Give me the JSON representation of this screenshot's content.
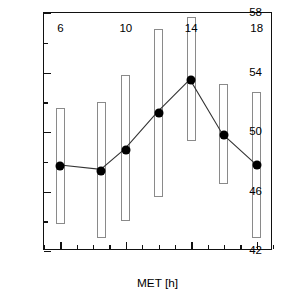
{
  "chart_data": {
    "type": "line",
    "title": "",
    "xlabel": "MET [h]",
    "ylabel": "Thermotolerance of PS II [°C]",
    "xlim": [
      5,
      19
    ],
    "ylim": [
      42,
      58
    ],
    "grid": false,
    "legend": null,
    "x_major_ticks": [
      6,
      10,
      14,
      18
    ],
    "x_minor_ticks": [
      5,
      7,
      8,
      9,
      11,
      12,
      13,
      15,
      16,
      17,
      19
    ],
    "x_tick_labels": [
      "6",
      "10",
      "14",
      "18"
    ],
    "y_major_ticks": [
      42,
      46,
      50,
      54,
      58
    ],
    "y_minor_ticks": [
      44,
      48,
      52,
      56
    ],
    "y_tick_labels": [
      "42",
      "46",
      "50",
      "54",
      "58"
    ],
    "marker": "filled-circle",
    "marker_color": "#000000",
    "line_color": "#333333",
    "errorbar_style": "open-rectangle",
    "errorbar_edge_color": "#8a8a8a",
    "errorbar_fill_color": "#ffffff",
    "x": [
      6,
      8.5,
      10,
      12,
      14,
      16,
      18
    ],
    "values": [
      47.7,
      47.4,
      48.8,
      51.3,
      53.5,
      49.8,
      47.8
    ],
    "range_low": [
      43.8,
      42.9,
      44.0,
      45.6,
      49.4,
      46.5,
      42.9
    ],
    "range_high": [
      51.6,
      52.0,
      53.8,
      56.9,
      57.7,
      53.2,
      52.7
    ],
    "points": [
      {
        "x": 6,
        "y": 47.7,
        "low": 43.8,
        "high": 51.6
      },
      {
        "x": 8.5,
        "y": 47.4,
        "low": 42.9,
        "high": 52.0
      },
      {
        "x": 10,
        "y": 48.8,
        "low": 44.0,
        "high": 53.8
      },
      {
        "x": 12,
        "y": 51.3,
        "low": 45.6,
        "high": 56.9
      },
      {
        "x": 14,
        "y": 53.5,
        "low": 49.4,
        "high": 57.7
      },
      {
        "x": 16,
        "y": 49.8,
        "low": 46.5,
        "high": 53.2
      },
      {
        "x": 18,
        "y": 47.8,
        "low": 42.9,
        "high": 52.7
      }
    ]
  }
}
